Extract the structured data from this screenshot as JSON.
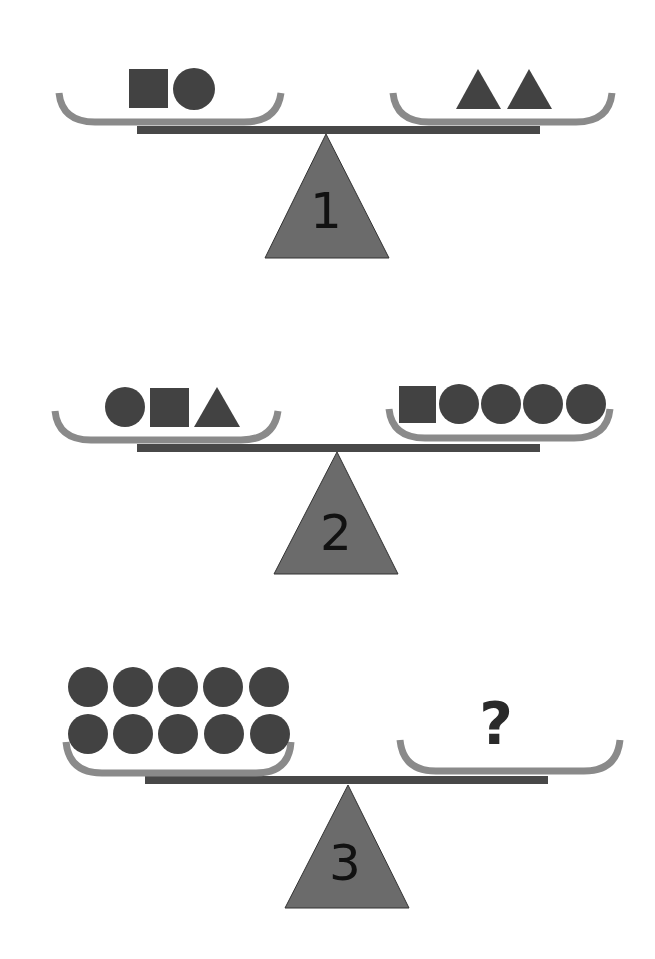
{
  "colors": {
    "shape": "#424242",
    "pan": "#8a8a8a",
    "beam": "#484848",
    "fulcrum": "#6b6b6b",
    "label": "#111111",
    "background": "#ffffff"
  },
  "scales": [
    {
      "label": "1",
      "left_pan": [
        "square",
        "circle"
      ],
      "right_pan": [
        "triangle",
        "triangle"
      ]
    },
    {
      "label": "2",
      "left_pan": [
        "circle",
        "square",
        "triangle"
      ],
      "right_pan": [
        "square",
        "circle",
        "circle",
        "circle",
        "circle"
      ]
    },
    {
      "label": "3",
      "left_pan": [
        "circle",
        "circle",
        "circle",
        "circle",
        "circle",
        "circle",
        "circle",
        "circle",
        "circle",
        "circle"
      ],
      "right_pan": [
        "?"
      ],
      "question_mark": "?"
    }
  ]
}
